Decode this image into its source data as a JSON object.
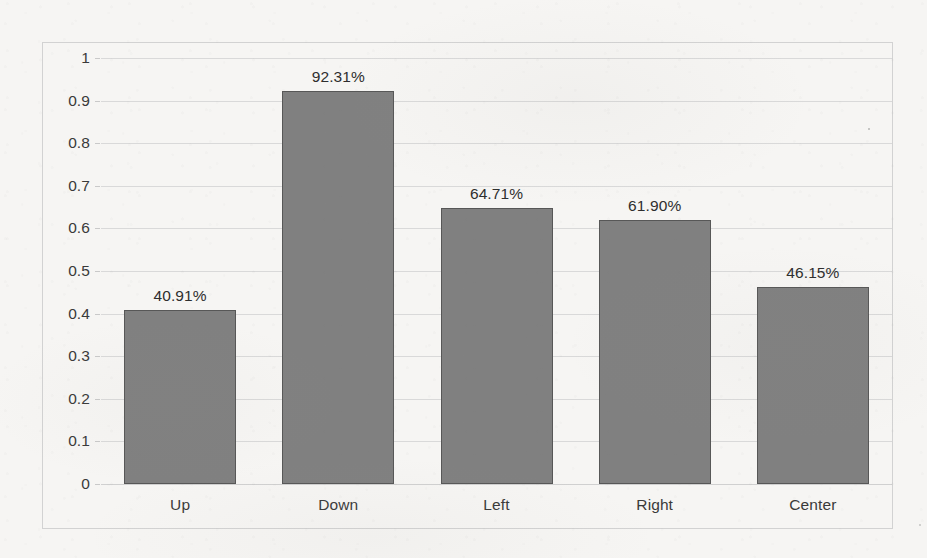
{
  "chart_data": {
    "type": "bar",
    "title": "",
    "subtitle": "",
    "xlabel": "",
    "ylabel": "",
    "categories": [
      "Up",
      "Down",
      "Left",
      "Right",
      "Center"
    ],
    "values": [
      0.4091,
      0.9231,
      0.6471,
      0.619,
      0.4615
    ],
    "data_labels": [
      "40.91%",
      "92.31%",
      "64.71%",
      "61.90%",
      "46.15%"
    ],
    "series": [
      {
        "name": "",
        "values": [
          0.4091,
          0.9231,
          0.6471,
          0.619,
          0.4615
        ],
        "color": "#808080"
      }
    ],
    "ylim": [
      0,
      1
    ],
    "xlim": [
      0,
      5
    ],
    "y_tick_values": [
      0,
      0.1,
      0.2,
      0.3,
      0.4,
      0.5,
      0.6,
      0.7,
      0.8,
      0.9,
      1
    ],
    "y_tick_labels": [
      "0",
      "0.1",
      "0.2",
      "0.3",
      "0.4",
      "0.5",
      "0.6",
      "0.7",
      "0.8",
      "0.9",
      "1"
    ],
    "grid": true,
    "grid_axis": "y",
    "legend": false,
    "legend_position": "none",
    "annotations": []
  },
  "style": {
    "bar_fill": "#808080",
    "bar_stroke": "#575757",
    "gridline_color": "#d9d9d9",
    "frame_border_color": "#d2d2d2",
    "text_color": "#3a3a3a",
    "background": "#f6f5f3"
  }
}
